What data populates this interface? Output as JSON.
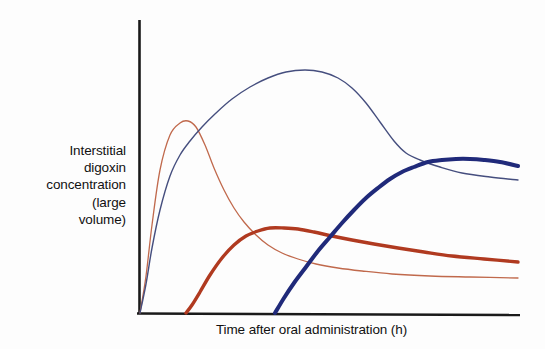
{
  "figure": {
    "background_color": "#fdfdfd",
    "axis_color": "#1a1a1a"
  },
  "chart_data": {
    "type": "line",
    "title": "",
    "xlabel": "Time after oral administration (h)",
    "ylabel": "Interstitial digoxin concentration (large volume)",
    "ylabel_lines": [
      "Interstitial",
      "digoxin",
      "concentration",
      "(large",
      "volume)"
    ],
    "grid": false,
    "legend_position": "none",
    "axis_ticks": [],
    "x": [
      0,
      1,
      2,
      3,
      4,
      5,
      6,
      7,
      8,
      9,
      10,
      11,
      12,
      13,
      14,
      15,
      16,
      17,
      18,
      19,
      20
    ],
    "xlim": [
      0,
      20
    ],
    "ylim": [
      0,
      100
    ],
    "series": [
      {
        "name": "thin-red-curve",
        "color": "#c0694c",
        "width": 1.3,
        "start_x": 0,
        "values": [
          0,
          62,
          96,
          100,
          88,
          70,
          56,
          46,
          38,
          32,
          28,
          25,
          23,
          21,
          20,
          19,
          18,
          17.5,
          17,
          16.5,
          16
        ],
        "points": [
          [
            140,
            313
          ],
          [
            146,
            276
          ],
          [
            152,
            225
          ],
          [
            160,
            170
          ],
          [
            170,
            135
          ],
          [
            180,
            123
          ],
          [
            188,
            121
          ],
          [
            196,
            127
          ],
          [
            205,
            145
          ],
          [
            214,
            168
          ],
          [
            224,
            190
          ],
          [
            234,
            208
          ],
          [
            244,
            222
          ],
          [
            256,
            235
          ],
          [
            268,
            245
          ],
          [
            282,
            253
          ],
          [
            298,
            259
          ],
          [
            316,
            264
          ],
          [
            338,
            268
          ],
          [
            362,
            271
          ],
          [
            392,
            274
          ],
          [
            430,
            276
          ],
          [
            470,
            277
          ],
          [
            518,
            278
          ]
        ]
      },
      {
        "name": "thin-blue-curve",
        "color": "#454e7e",
        "width": 1.4,
        "start_x": 0,
        "values": [
          0,
          30,
          58,
          74,
          85,
          92,
          97,
          100,
          99,
          95,
          88,
          79,
          70,
          62,
          56,
          52,
          50,
          49,
          48,
          47.5,
          47
        ],
        "points": [
          [
            140,
            313
          ],
          [
            146,
            284
          ],
          [
            152,
            248
          ],
          [
            160,
            210
          ],
          [
            170,
            176
          ],
          [
            180,
            155
          ],
          [
            190,
            141
          ],
          [
            202,
            127
          ],
          [
            216,
            113
          ],
          [
            232,
            99
          ],
          [
            250,
            87
          ],
          [
            268,
            78
          ],
          [
            286,
            72
          ],
          [
            305,
            70
          ],
          [
            322,
            72
          ],
          [
            338,
            78
          ],
          [
            352,
            88
          ],
          [
            366,
            103
          ],
          [
            380,
            122
          ],
          [
            394,
            141
          ],
          [
            406,
            153
          ],
          [
            420,
            160
          ],
          [
            440,
            167
          ],
          [
            462,
            173
          ],
          [
            490,
            177
          ],
          [
            518,
            180
          ]
        ]
      },
      {
        "name": "thick-red-curve",
        "color": "#b03a20",
        "width": 3.4,
        "start_x": 2.4,
        "values": [
          null,
          null,
          0,
          22,
          48,
          66,
          74,
          76,
          75,
          73,
          70,
          67,
          64,
          61,
          58,
          55,
          53,
          51,
          49,
          47,
          45
        ],
        "points": [
          [
            186,
            313
          ],
          [
            192,
            305
          ],
          [
            200,
            292
          ],
          [
            210,
            275
          ],
          [
            222,
            258
          ],
          [
            234,
            245
          ],
          [
            246,
            236
          ],
          [
            258,
            231
          ],
          [
            270,
            228
          ],
          [
            284,
            228
          ],
          [
            298,
            229
          ],
          [
            314,
            232
          ],
          [
            332,
            236
          ],
          [
            352,
            240
          ],
          [
            374,
            244
          ],
          [
            398,
            248
          ],
          [
            424,
            252
          ],
          [
            452,
            256
          ],
          [
            484,
            259
          ],
          [
            518,
            262
          ]
        ]
      },
      {
        "name": "thick-blue-curve",
        "color": "#202a7a",
        "width": 4.0,
        "start_x": 7.0,
        "values": [
          null,
          null,
          null,
          null,
          null,
          null,
          null,
          0,
          16,
          34,
          52,
          66,
          76,
          83,
          88,
          90,
          91,
          91,
          90.5,
          90,
          89.5
        ],
        "points": [
          [
            275,
            313
          ],
          [
            284,
            298
          ],
          [
            294,
            283
          ],
          [
            306,
            267
          ],
          [
            318,
            251
          ],
          [
            330,
            237
          ],
          [
            342,
            223
          ],
          [
            354,
            210
          ],
          [
            366,
            198
          ],
          [
            378,
            188
          ],
          [
            390,
            179
          ],
          [
            402,
            172
          ],
          [
            414,
            167
          ],
          [
            428,
            162
          ],
          [
            442,
            160
          ],
          [
            456,
            159
          ],
          [
            470,
            159
          ],
          [
            484,
            160
          ],
          [
            500,
            162
          ],
          [
            518,
            166
          ]
        ]
      }
    ]
  },
  "axes": {
    "x_axis_line": {
      "x1": 137,
      "y1": 313,
      "x2": 520,
      "y2": 315
    },
    "y_axis_line": {
      "x1": 139,
      "y1": 20,
      "x2": 139,
      "y2": 313
    }
  }
}
